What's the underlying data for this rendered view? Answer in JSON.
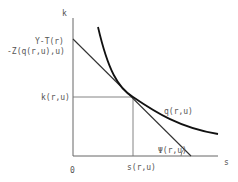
{
  "diagram": {
    "axes": {
      "y_label": "k",
      "x_label": "s",
      "origin_label": "0"
    },
    "labels": {
      "intercept_line1": "Y-T(r)",
      "intercept_line2": "-Z(q(r,u),u)",
      "k_level": "k(r,u)",
      "s_level": "s(r,u)",
      "curve": "q(r,u)",
      "angle": "Ψ(r,u)"
    },
    "colors": {
      "curve": "#111111",
      "tangent_line": "#333333",
      "axes": "#666666"
    }
  }
}
